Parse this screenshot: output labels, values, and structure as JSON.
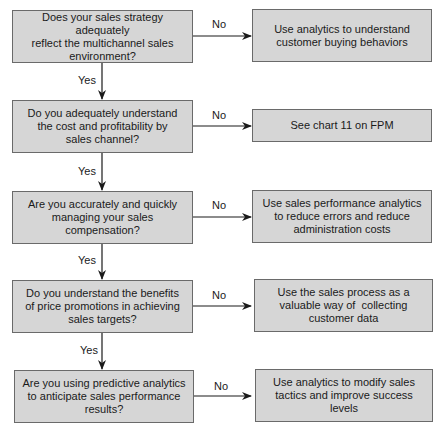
{
  "diagram": {
    "type": "flowchart",
    "colors": {
      "box_fill": "#d6d6d6",
      "box_border": "#6a6a6a",
      "line": "#1a1a1a"
    },
    "steps": [
      {
        "question": "Does your sales strategy adequately reflect the multichannel sales environment?",
        "question_lines": [
          "Does your sales strategy adequately",
          "reflect the multichannel sales",
          "environment?"
        ],
        "no_label": "No",
        "action": "Use analytics to understand customer buying behaviors",
        "action_lines": [
          "Use analytics to understand",
          "customer buying behaviors"
        ],
        "yes_label": "Yes"
      },
      {
        "question": "Do you adequately understand the cost and profitability by sales channel?",
        "question_lines": [
          "Do you adequately understand",
          "the cost and profitability by",
          "sales channel?"
        ],
        "no_label": "No",
        "action": "See chart 11 on FPM",
        "action_lines": [
          "See chart 11 on FPM"
        ],
        "yes_label": "Yes"
      },
      {
        "question": "Are you accurately and quickly managing your sales compensation?",
        "question_lines": [
          "Are you accurately and quickly",
          "managing your sales",
          "compensation?"
        ],
        "no_label": "No",
        "action": "Use sales performance analytics to reduce errors and reduce administration costs",
        "action_lines": [
          "Use sales performance analytics",
          "to reduce errors and reduce",
          "administration costs"
        ],
        "yes_label": "Yes"
      },
      {
        "question": "Do you understand the benefits of price promotions in achieving sales targets?",
        "question_lines": [
          "Do you understand the benefits",
          "of price promotions in achieving",
          "sales targets?"
        ],
        "no_label": "No",
        "action": "Use the sales process as a valuable way of collecting customer data",
        "action_lines": [
          "Use the sales process as a",
          "valuable way of  collecting",
          "customer data"
        ],
        "yes_label": "Yes"
      },
      {
        "question": "Are you using predictive analytics to anticipate sales performance results?",
        "question_lines": [
          "Are you using predictive analytics",
          "to anticipate sales performance",
          "results?"
        ],
        "no_label": "No",
        "action": "Use analytics to modify sales tactics and improve success levels",
        "action_lines": [
          "Use analytics to modify sales",
          "tactics and improve success levels"
        ]
      }
    ]
  }
}
